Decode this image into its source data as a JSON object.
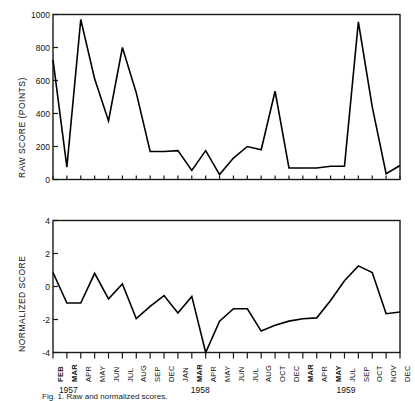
{
  "figure": {
    "caption": "Fig. 1. Raw and normalized scores."
  },
  "chart_data": [
    {
      "id": "top",
      "type": "line",
      "title": "",
      "xlabel": "",
      "ylabel": "RAW SCORE (POINTS)",
      "ylim": [
        0,
        1000
      ],
      "yticks": [
        0,
        200,
        400,
        600,
        800,
        1000
      ],
      "ytick_labels": [
        "0",
        "200",
        "400",
        "600",
        "800",
        "1000"
      ],
      "grid": false,
      "legend": "none",
      "categories": [
        "FEB",
        "MAR",
        "APR",
        "MAY",
        "JUN",
        "JUL",
        "AUG",
        "SEP",
        "DEC",
        "JAN",
        "MAR",
        "APR",
        "MAY",
        "JUN",
        "JUL",
        "AUG",
        "OCT",
        "DEC",
        "MAR",
        "APR",
        "MAY",
        "JUL",
        "SEP",
        "OCT",
        "NOV",
        "DEC"
      ],
      "values": [
        725,
        75,
        970,
        610,
        355,
        800,
        525,
        170,
        170,
        175,
        55,
        175,
        30,
        130,
        200,
        180,
        535,
        70,
        70,
        70,
        80,
        80,
        955,
        440,
        35,
        85
      ]
    },
    {
      "id": "bottom",
      "type": "line",
      "title": "",
      "xlabel": "",
      "ylabel": "NORMALIZED SCORE",
      "ylim": [
        -4,
        4
      ],
      "yticks": [
        -4,
        -2,
        0,
        2,
        4
      ],
      "ytick_labels": [
        "-4",
        "-2",
        "0",
        "2",
        "4"
      ],
      "grid": false,
      "legend": "none",
      "categories": [
        "FEB",
        "MAR",
        "APR",
        "MAY",
        "JUN",
        "JUL",
        "AUG",
        "SEP",
        "DEC",
        "JAN",
        "MAR",
        "APR",
        "MAY",
        "JUN",
        "JUL",
        "AUG",
        "OCT",
        "DEC",
        "MAR",
        "APR",
        "MAY",
        "JUL",
        "SEP",
        "OCT",
        "NOV",
        "DEC"
      ],
      "values": [
        0.85,
        -1.0,
        -1.0,
        0.8,
        -0.75,
        0.15,
        -1.95,
        -1.2,
        -0.55,
        -1.6,
        -0.6,
        -4.0,
        -2.1,
        -1.35,
        -1.35,
        -2.7,
        -2.35,
        -2.1,
        -1.95,
        -1.9,
        -0.85,
        0.35,
        1.25,
        0.85,
        -1.65,
        -1.55
      ]
    }
  ],
  "xaxis": {
    "tick_labels": [
      {
        "label": "FEB",
        "bold": true
      },
      {
        "label": "MAR",
        "bold": true
      },
      {
        "label": "APR",
        "bold": false
      },
      {
        "label": "MAY",
        "bold": false
      },
      {
        "label": "JUN",
        "bold": false
      },
      {
        "label": "JUL",
        "bold": false
      },
      {
        "label": "AUG",
        "bold": false
      },
      {
        "label": "SEP",
        "bold": false
      },
      {
        "label": "DEC",
        "bold": false
      },
      {
        "label": "JAN",
        "bold": false
      },
      {
        "label": "MAR",
        "bold": true
      },
      {
        "label": "APR",
        "bold": false
      },
      {
        "label": "MAY",
        "bold": false
      },
      {
        "label": "JUN",
        "bold": false
      },
      {
        "label": "JUL",
        "bold": false
      },
      {
        "label": "AUG",
        "bold": false
      },
      {
        "label": "OCT",
        "bold": false
      },
      {
        "label": "DEC",
        "bold": false
      },
      {
        "label": "MAR",
        "bold": true
      },
      {
        "label": "APR",
        "bold": false
      },
      {
        "label": "MAY",
        "bold": true
      },
      {
        "label": "JUL",
        "bold": false
      },
      {
        "label": "SEP",
        "bold": false
      },
      {
        "label": "OCT",
        "bold": false
      },
      {
        "label": "NOV",
        "bold": false
      },
      {
        "label": "DEC",
        "bold": false
      }
    ],
    "year_labels": [
      {
        "text": "1957",
        "index": 1
      },
      {
        "text": "1958",
        "index": 10.5
      },
      {
        "text": "1959",
        "index": 21
      }
    ]
  },
  "style": {
    "line_color": "#000000",
    "axis_color": "#1a1a1a",
    "background": "#ffffff"
  }
}
